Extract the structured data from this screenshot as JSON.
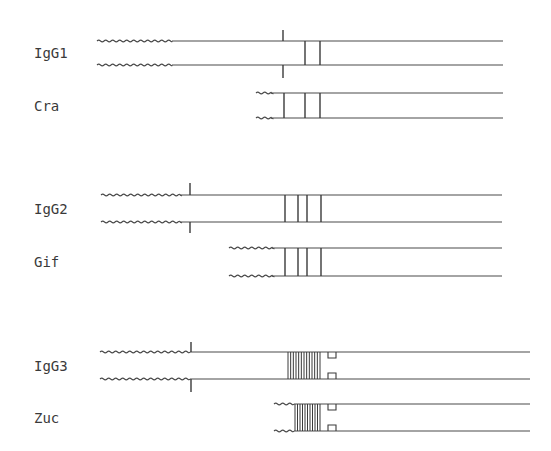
{
  "diagram": {
    "type": "immunoglobulin hinge-region schematic",
    "groups": [
      {
        "chains": [
          {
            "label": "IgG1",
            "y_top": 41,
            "y_bottom": 65,
            "wavy_start": 97,
            "wavy_end": 172,
            "line_end": 503,
            "tick_x": 283,
            "tick_up_top": 30,
            "tick_down_bottom": 78,
            "bars": [
              305,
              320
            ],
            "hatch": null,
            "squares": false
          },
          {
            "label": "Cra",
            "y_top": 93,
            "y_bottom": 118,
            "wavy_start": 256,
            "wavy_end": 271,
            "line_end": 503,
            "tick_x": null,
            "bars": [
              284,
              305,
              320
            ],
            "hatch": null,
            "squares": false
          }
        ]
      },
      {
        "chains": [
          {
            "label": "IgG2",
            "y_top": 195,
            "y_bottom": 222,
            "wavy_start": 101,
            "wavy_end": 180,
            "line_end": 502,
            "tick_x": 190,
            "tick_up_top": 183,
            "tick_down_bottom": 233,
            "bars": [
              285,
              298,
              307,
              321
            ],
            "hatch": null,
            "squares": false
          },
          {
            "label": "Gif",
            "y_top": 248,
            "y_bottom": 276,
            "wavy_start": 229,
            "wavy_end": 272,
            "line_end": 502,
            "tick_x": null,
            "bars": [
              285,
              298,
              307,
              321
            ],
            "hatch": null,
            "squares": false
          }
        ]
      },
      {
        "chains": [
          {
            "label": "IgG3",
            "y_top": 352,
            "y_bottom": 379,
            "wavy_start": 100,
            "wavy_end": 190,
            "line_end": 530,
            "tick_x": 191,
            "tick_up_top": 342,
            "tick_down_bottom": 392,
            "bars": [],
            "hatch": {
              "x_start": 288,
              "x_end": 320,
              "count": 12
            },
            "squares": true,
            "square_x": 328
          },
          {
            "label": "Zuc",
            "y_top": 404,
            "y_bottom": 431,
            "wavy_start": 274,
            "wavy_end": 294,
            "line_end": 530,
            "tick_x": null,
            "bars": [],
            "hatch": {
              "x_start": 295,
              "x_end": 320,
              "count": 10
            },
            "squares": true,
            "square_x": 328
          }
        ]
      }
    ]
  }
}
